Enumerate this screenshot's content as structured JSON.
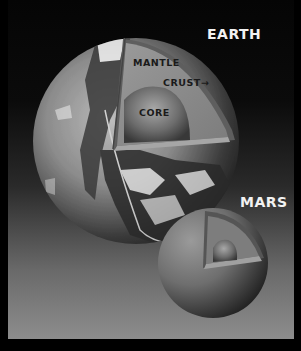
{
  "diagram": {
    "type": "planetary-interior-comparison",
    "planets": [
      {
        "name": "EARTH",
        "layers": [
          {
            "label": "MANTLE"
          },
          {
            "label": "CRUST",
            "pointer": "→"
          },
          {
            "label": "CORE"
          }
        ]
      },
      {
        "name": "MARS",
        "layers": []
      }
    ]
  },
  "labels": {
    "earth": "EARTH",
    "mars": "MARS",
    "mantle": "MANTLE",
    "crust": "CRUST→",
    "core": "CORE"
  },
  "colors": {
    "background_top": "#050505",
    "background_bottom": "#8d8d8d",
    "mantle": "#8a8a8a",
    "crust": "#5e5e5e",
    "core": "#6a6a6a",
    "title_text": "#f2f2f2",
    "layer_text": "#1a1a1a"
  }
}
